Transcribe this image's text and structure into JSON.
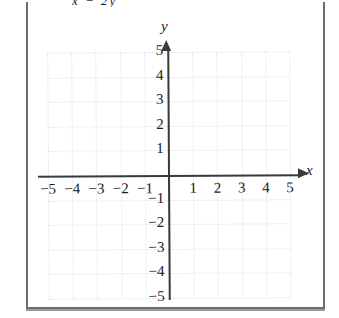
{
  "top_expression": "x − 2y",
  "figure": {
    "x_axis_label": "x",
    "y_axis_label": "y",
    "x_ticks": [
      "−5",
      "−4",
      "−3",
      "−2",
      "−1",
      "1",
      "2",
      "3",
      "4",
      "5"
    ],
    "y_ticks": [
      "5",
      "4",
      "3",
      "2",
      "1",
      "−1",
      "−2",
      "−3",
      "−4",
      "−5"
    ]
  },
  "chart_data": {
    "type": "scatter",
    "title": "",
    "subtitle": "",
    "xlabel": "x",
    "ylabel": "y",
    "xlim": [
      -5,
      5
    ],
    "ylim": [
      -5,
      5
    ],
    "xticks": [
      -5,
      -4,
      -3,
      -2,
      -1,
      1,
      2,
      3,
      4,
      5
    ],
    "yticks": [
      5,
      4,
      3,
      2,
      1,
      -1,
      -2,
      -3,
      -4,
      -5
    ],
    "xtick_labels": [
      "−5",
      "−4",
      "−3",
      "−2",
      "−1",
      "1",
      "2",
      "3",
      "4",
      "5"
    ],
    "ytick_labels": [
      "5",
      "4",
      "3",
      "2",
      "1",
      "−1",
      "−2",
      "−3",
      "−4",
      "−5"
    ],
    "grid": true,
    "grid_style": "dotted",
    "grid_color": "#e2e2e2",
    "axis_color": "#3a3a3a",
    "legend": null,
    "series": [],
    "annotations": [],
    "note": "Empty blank coordinate grid — no data plotted; axes drawn with arrowheads on positive x and positive y directions."
  }
}
